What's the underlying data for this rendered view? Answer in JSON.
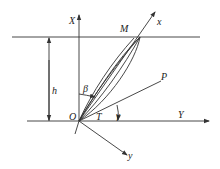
{
  "diagram": {
    "labels": {
      "X": "X",
      "Y": "Y",
      "x": "x",
      "y": "y",
      "M": "M",
      "P": "P",
      "O": "O",
      "T": "T",
      "h": "h",
      "beta": "β",
      "gamma": "γ"
    },
    "colors": {
      "line": "#333333",
      "background": "#ffffff"
    }
  }
}
